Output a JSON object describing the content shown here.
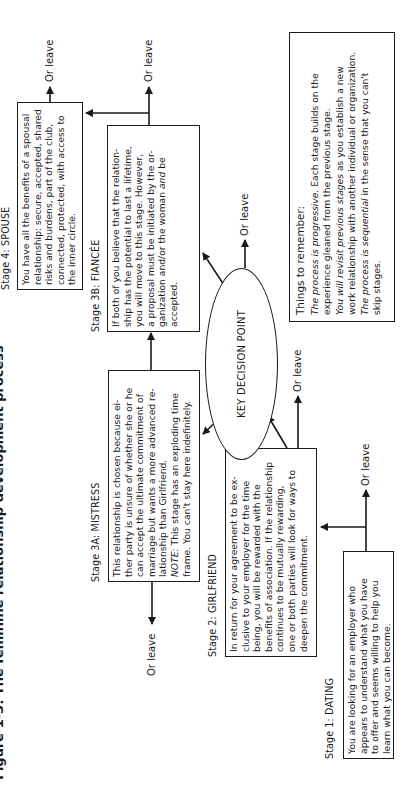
{
  "title": "Figure 1-3: The feminine relationship development process",
  "exit_label": "Or leave",
  "decision": {
    "label": "KEY DECISION POINT"
  },
  "stages": {
    "dating": {
      "label": "Stage 1: DATING",
      "lines": [
        "You are looking for an employer who",
        "appears to understand what you have",
        "to offer and seems willing to help you",
        "learn what you can become."
      ]
    },
    "girlfriend": {
      "label": "Stage 2: GIRLFRIEND",
      "lines": [
        "In return for your agreement to be ex-",
        "clusive to your employer for the time",
        "being, you will be rewarded with the",
        "benefits of association. If the relationship",
        "continues to be mutually rewarding,",
        "one or both parties will look for ways to",
        "deepen the commitment."
      ]
    },
    "mistress": {
      "label": "Stage 3A: MISTRESS",
      "lines": [
        "This relationship is chosen because ei-",
        "ther party is unsure of whether she or he",
        "can accept the ultimate commitment of",
        "marriage but wants a more advanced re-",
        "lationship than Girlfriend."
      ],
      "note_prefix": "NOTE:",
      "note_lines": [
        " This stage has an exploding time",
        "frame. You can't stay here indefinitely."
      ]
    },
    "fiancee": {
      "label": "Stage 3B: FIANCÉE",
      "lines": [
        "If both of you believe that the relation-",
        "ship has the potential to last a lifetime,",
        "you will move to this stage. However,",
        "a proposal must be initiated by the or-",
        "ganization and/or the woman"
      ],
      "and_word": "and",
      "tail": " be",
      "last_line": "accepted."
    },
    "spouse": {
      "label": "Stage 4: SPOUSE",
      "lines": [
        "You have all the benefits of a spousal",
        "relationship: secure, accepted, shared",
        "risks and burdens, part of the club,",
        "connected, protected, with access to",
        "the inner circle."
      ]
    }
  },
  "remember": {
    "heading": "Things to remember:",
    "items": [
      {
        "em": "The process is progressive.",
        "rest_lines": [
          " Each stage builds on the",
          "experience gleaned from the previous stage."
        ]
      },
      {
        "em": "You will revisit previous stages",
        "rest_lines": [
          " as you establish a new",
          "work relationship with another individual or organization."
        ]
      },
      {
        "em_pre": "The process is ",
        "em": "sequential",
        "rest_lines": [
          " in the sense that you can't",
          "skip stages."
        ]
      }
    ]
  },
  "colors": {
    "ink": "#1a1a1a",
    "background": "#ffffff"
  }
}
